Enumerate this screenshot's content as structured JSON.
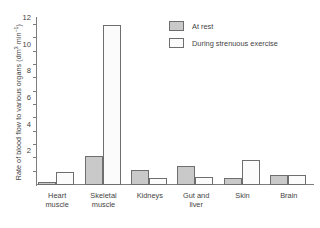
{
  "chart_data": {
    "type": "bar",
    "title": "",
    "xlabel": "",
    "ylabel": "Rate of blood flow to various organs (dm³ min⁻¹)",
    "ylabel_main": "Rate of blood flow to various organs (dm",
    "ylabel_sup1": "3",
    "ylabel_mid": " min",
    "ylabel_sup2": "−1",
    "ylabel_end": ")",
    "ylim": [
      0,
      12.6
    ],
    "ytick_step": 1,
    "ytick_labels": [
      "2",
      "4",
      "6",
      "8",
      "10",
      "12"
    ],
    "ytick_values": [
      2,
      4,
      6,
      8,
      10,
      12
    ],
    "grid": false,
    "legend_position": "upper-right-inside",
    "categories": [
      "Heart\nmuscle",
      "Skeletal\nmuscle",
      "Kidneys",
      "Gut and\nliver",
      "Skin",
      "Brain"
    ],
    "series": [
      {
        "name": "At rest",
        "color": "#c9c9c9",
        "values": [
          0.25,
          2.2,
          1.1,
          1.4,
          0.5,
          0.75
        ]
      },
      {
        "name": "During strenuous exercise",
        "color": "#fbfbfb",
        "values": [
          1.0,
          12.0,
          0.5,
          0.6,
          1.9,
          0.75
        ]
      }
    ]
  },
  "legend": {
    "items": [
      {
        "label": "At rest",
        "swatch": "rest"
      },
      {
        "label": "During strenuous exercise",
        "swatch": "exercise"
      }
    ]
  },
  "colors": {
    "bar_rest_fill": "#c9c9c9",
    "bar_exercise_fill": "#fbfbfb",
    "bar_stroke": "#6e6e6e",
    "axis": "#7d7d7d",
    "text": "#3f3f3f",
    "background": "#ffffff"
  }
}
